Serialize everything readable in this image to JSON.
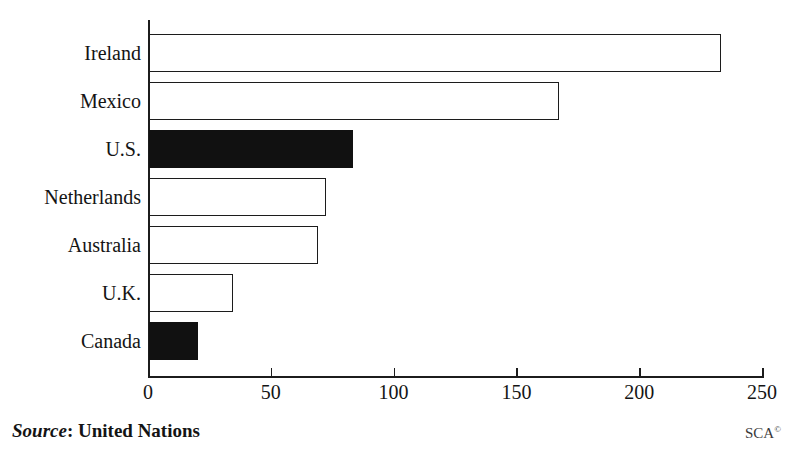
{
  "title_remnant": "",
  "footer": {
    "source_label": "Source",
    "source_separator": ": ",
    "source_value": "United Nations",
    "credit": "SCA",
    "credit_mark": "©"
  },
  "colors": {
    "axis": "#1c1c1c",
    "bar_outline": "#1c1c1c",
    "bar_fill_empty": "#ffffff",
    "bar_fill_highlight": "#111111",
    "text": "#141414",
    "background": "#ffffff"
  },
  "chart_data": {
    "type": "bar",
    "orientation": "horizontal",
    "title": "",
    "xlabel": "",
    "ylabel": "",
    "xlim": [
      0,
      250
    ],
    "xticks": [
      0,
      50,
      100,
      150,
      200,
      250
    ],
    "xtick_labels": [
      "0",
      "50",
      "100",
      "150",
      "200",
      "250"
    ],
    "grid": false,
    "legend": null,
    "categories": [
      "Ireland",
      "Mexico",
      "U.S.",
      "Netherlands",
      "Australia",
      "U.K.",
      "Canada"
    ],
    "values": [
      233,
      167,
      83,
      72,
      69,
      34,
      20
    ],
    "highlighted": [
      "U.S.",
      "Canada"
    ],
    "bars": [
      {
        "category": "Ireland",
        "value": 233,
        "style": "outline"
      },
      {
        "category": "Mexico",
        "value": 167,
        "style": "outline"
      },
      {
        "category": "U.S.",
        "value": 83,
        "style": "filled"
      },
      {
        "category": "Netherlands",
        "value": 72,
        "style": "outline"
      },
      {
        "category": "Australia",
        "value": 69,
        "style": "outline"
      },
      {
        "category": "U.K.",
        "value": 34,
        "style": "outline"
      },
      {
        "category": "Canada",
        "value": 20,
        "style": "filled"
      }
    ]
  }
}
